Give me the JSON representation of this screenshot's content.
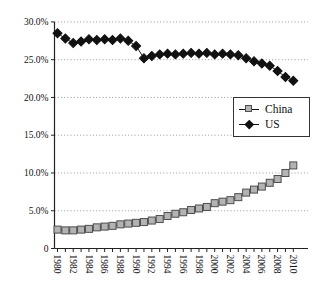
{
  "chart_data": {
    "type": "line",
    "title": "",
    "xlabel": "",
    "ylabel": "",
    "x": [
      1980,
      1981,
      1982,
      1983,
      1984,
      1985,
      1986,
      1987,
      1988,
      1989,
      1990,
      1991,
      1992,
      1993,
      1994,
      1995,
      1996,
      1997,
      1998,
      1999,
      2000,
      2001,
      2002,
      2003,
      2004,
      2005,
      2006,
      2007,
      2008,
      2009,
      2010
    ],
    "series": [
      {
        "name": "China",
        "marker": "square",
        "fill": "#b3b3b3",
        "edge": "#4d4d4d",
        "values": [
          2.5,
          2.4,
          2.4,
          2.5,
          2.6,
          2.8,
          2.9,
          3.0,
          3.2,
          3.3,
          3.4,
          3.5,
          3.7,
          3.9,
          4.3,
          4.6,
          4.8,
          5.1,
          5.3,
          5.5,
          6.0,
          6.2,
          6.4,
          6.8,
          7.4,
          7.8,
          8.2,
          8.7,
          9.2,
          10.0,
          11.0
        ]
      },
      {
        "name": "US",
        "marker": "diamond",
        "fill": "#111111",
        "edge": "#111111",
        "values": [
          28.5,
          27.8,
          27.2,
          27.4,
          27.7,
          27.6,
          27.7,
          27.6,
          27.8,
          27.5,
          26.8,
          25.2,
          25.5,
          25.7,
          25.8,
          25.7,
          25.8,
          25.9,
          25.8,
          25.9,
          25.7,
          25.8,
          25.7,
          25.6,
          25.2,
          24.8,
          24.5,
          24.2,
          23.5,
          22.7,
          22.2
        ]
      }
    ],
    "ylim": [
      0,
      30
    ],
    "ytick_values": [
      30,
      25,
      20,
      15,
      10,
      5,
      0
    ],
    "ytick_labels": [
      "30.0%",
      "25.0%",
      "20.0%",
      "15.0%",
      "10.0%",
      "5.0%",
      "0"
    ],
    "xtick_labels": [
      "1980",
      "1982",
      "1984",
      "1986",
      "1988",
      "1990",
      "1992",
      "1994",
      "1996",
      "1998",
      "2000",
      "2002",
      "2004",
      "2006",
      "2008",
      "2010"
    ],
    "grid": "horizontal-dotted",
    "legend_position": "middle-right",
    "line_color": "#1a1a1a",
    "grid_color": "#9a9a9a",
    "axis_color": "#222222",
    "background": "#ffffff"
  },
  "legend": {
    "items": [
      {
        "label": "China"
      },
      {
        "label": "US"
      }
    ]
  }
}
